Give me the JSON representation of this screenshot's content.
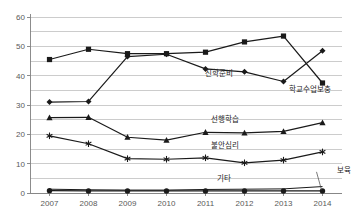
{
  "chart_data": {
    "type": "line",
    "title": "",
    "xlabel": "",
    "ylabel": "",
    "x": [
      "2007",
      "2008",
      "2009",
      "2010",
      "2011",
      "2012",
      "2013",
      "2014"
    ],
    "categories": [
      "2007",
      "2008",
      "2009",
      "2010",
      "2011",
      "2012",
      "2013",
      "2014"
    ],
    "ylim": [
      0,
      60
    ],
    "ytick_labels": [
      "0",
      "10",
      "20",
      "30",
      "40",
      "50",
      "60"
    ],
    "ytick_values": [
      0,
      10,
      20,
      30,
      40,
      50,
      60
    ],
    "minor_gridline_step": 5,
    "grid": true,
    "legend": "inline-annotations",
    "series": [
      {
        "name": "학교수업보충",
        "marker": "square",
        "color": "#1a1a1a",
        "values": [
          45.5,
          49.0,
          47.5,
          47.5,
          48.0,
          51.5,
          53.5,
          37.5
        ],
        "label_x": 2014,
        "label_y": 37.5
      },
      {
        "name": "진학준비",
        "marker": "diamond",
        "color": "#1a1a1a",
        "values": [
          31.0,
          31.2,
          46.5,
          47.3,
          42.3,
          41.3,
          38.0,
          48.5
        ],
        "label_x": 2012,
        "label_y": 38.0
      },
      {
        "name": "선행학습",
        "marker": "triangle",
        "color": "#1a1a1a",
        "values": [
          25.7,
          25.8,
          19.0,
          18.0,
          20.7,
          20.5,
          21.0,
          24.0
        ],
        "label_x": 2012,
        "label_y": 22.5
      },
      {
        "name": "불안심리",
        "marker": "asterisk",
        "color": "#1a1a1a",
        "values": [
          19.5,
          16.8,
          11.7,
          11.5,
          12.0,
          10.3,
          11.2,
          14.0
        ],
        "label_x": 2012,
        "label_y": 13.5
      },
      {
        "name": "기타",
        "marker": "none",
        "color": "#1a1a1a",
        "values": [
          1.3,
          1.1,
          1.0,
          1.0,
          1.2,
          1.3,
          1.4,
          2.2
        ],
        "label_x": 2012,
        "label_y": 4.0
      },
      {
        "name": "보육",
        "marker": "circle",
        "color": "#1a1a1a",
        "values": [
          0.8,
          0.7,
          0.7,
          0.7,
          0.7,
          0.7,
          0.7,
          0.7
        ],
        "label_x": 2014,
        "label_y": 5.5
      }
    ]
  },
  "axis": {
    "y_labels": [
      "60",
      "50",
      "40",
      "30",
      "20",
      "10",
      "0"
    ],
    "x_labels": [
      "2007",
      "2008",
      "2009",
      "2010",
      "2011",
      "2012",
      "2013",
      "2014"
    ]
  },
  "annotations": {
    "jinhak_junbi": "진학준비",
    "hakgyo_sueop_bochung": "학교수업보충",
    "seonhaeng_hakseup": "선행학습",
    "buran_simni": "불안심리",
    "gita": "기타",
    "boyuk": "보육"
  },
  "colors": {
    "line": "#1a1a1a",
    "gridline": "#bfbfbf",
    "axis": "#808080",
    "tick_text": "#595959"
  }
}
